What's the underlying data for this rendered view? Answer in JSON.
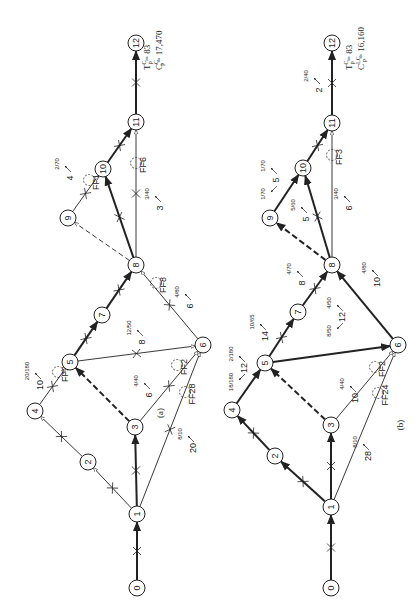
{
  "figure": {
    "rotation_deg": -90
  },
  "diagrams": [
    {
      "id": "a",
      "caption": "(a)",
      "caption_pos": [
        163,
        413
      ],
      "summary": {
        "time_label": "T",
        "time_sup": "C",
        "time_sub": "P",
        "time_value": "= 83",
        "cost_label": "C",
        "cost_sup": "C",
        "cost_sub": "P",
        "cost_value": "= 17,470",
        "pos": [
          150,
          30
        ]
      },
      "nodes": [
        {
          "id": "0",
          "x": 137,
          "y": 588
        },
        {
          "id": "1",
          "x": 137,
          "y": 514
        },
        {
          "id": "2",
          "x": 88,
          "y": 462
        },
        {
          "id": "3",
          "x": 135,
          "y": 427
        },
        {
          "id": "4",
          "x": 35,
          "y": 411
        },
        {
          "id": "5",
          "x": 70,
          "y": 362
        },
        {
          "id": "6",
          "x": 203,
          "y": 345
        },
        {
          "id": "7",
          "x": 102,
          "y": 315
        },
        {
          "id": "8",
          "x": 136,
          "y": 265
        },
        {
          "id": "9",
          "x": 68,
          "y": 218
        },
        {
          "id": "10",
          "x": 103,
          "y": 169
        },
        {
          "id": "11",
          "x": 136,
          "y": 122
        },
        {
          "id": "12",
          "x": 136,
          "y": 43
        }
      ],
      "edges": [
        {
          "from": "0",
          "to": "1",
          "style": "bold",
          "cross": true
        },
        {
          "from": "1",
          "to": "2",
          "style": "thin",
          "cross": true,
          "open_arrow": true
        },
        {
          "from": "1",
          "to": "3",
          "style": "bold",
          "cross": true
        },
        {
          "from": "1",
          "to": "6",
          "style": "thin",
          "cross": true,
          "open_arrow": true
        },
        {
          "from": "2",
          "to": "4",
          "style": "thin",
          "cross": true,
          "open_arrow": true
        },
        {
          "from": "4",
          "to": "5",
          "style": "thin",
          "cross": true,
          "open_arrow": true
        },
        {
          "from": "3",
          "to": "5",
          "style": "bold-dashed",
          "cross": false
        },
        {
          "from": "3",
          "to": "6",
          "style": "thin",
          "cross": true,
          "open_arrow": true
        },
        {
          "from": "5",
          "to": "6",
          "style": "thin",
          "cross": true,
          "open_arrow": true
        },
        {
          "from": "5",
          "to": "7",
          "style": "bold",
          "cross": true
        },
        {
          "from": "7",
          "to": "8",
          "style": "bold",
          "cross": true
        },
        {
          "from": "6",
          "to": "8",
          "style": "thin",
          "cross": true,
          "open_arrow": true
        },
        {
          "from": "8",
          "to": "9",
          "style": "thin-dashed",
          "cross": false,
          "open_arrow": true
        },
        {
          "from": "8",
          "to": "10",
          "style": "bold",
          "cross": true
        },
        {
          "from": "8",
          "to": "11",
          "style": "thin",
          "cross": true,
          "open_arrow": true
        },
        {
          "from": "9",
          "to": "10",
          "style": "thin",
          "cross": true,
          "open_arrow": true
        },
        {
          "from": "10",
          "to": "11",
          "style": "bold",
          "cross": true
        },
        {
          "from": "11",
          "to": "12",
          "style": "bold",
          "cross": true
        }
      ],
      "float_markers": [
        {
          "label": "FF2",
          "x": 58,
          "y": 372
        },
        {
          "label": "FF2",
          "x": 177,
          "y": 365
        },
        {
          "label": "FF28",
          "x": 185,
          "y": 392
        },
        {
          "label": "FF8",
          "x": 156,
          "y": 283
        },
        {
          "label": "FF1",
          "x": 89,
          "y": 180
        },
        {
          "label": "FF6",
          "x": 136,
          "y": 163
        }
      ],
      "annotations": [
        {
          "value": "10",
          "rate": "20/180",
          "x": 43,
          "y": 385
        },
        {
          "value": "6",
          "rate": "4/40",
          "x": 152,
          "y": 395
        },
        {
          "value": "20",
          "rate": "8/10",
          "x": 196,
          "y": 448
        },
        {
          "value": "8",
          "rate": "12/50",
          "x": 145,
          "y": 342
        },
        {
          "value": "6",
          "rate": "4/80",
          "x": 193,
          "y": 306
        },
        {
          "value": "4",
          "rate": "2/70",
          "x": 73,
          "y": 178
        },
        {
          "value": "3",
          "rate": "3/40",
          "x": 163,
          "y": 208
        }
      ]
    },
    {
      "id": "b",
      "caption": "(b)",
      "caption_pos": [
        403,
        425
      ],
      "summary": {
        "time_label": "T",
        "time_sup": "C",
        "time_sub": "P",
        "time_value": "= 83",
        "cost_label": "C",
        "cost_sup": "LC",
        "cost_sub": "P",
        "cost_value": "= 16,160",
        "pos": [
          352,
          30
        ]
      },
      "nodes": [
        {
          "id": "0",
          "x": 331,
          "y": 588
        },
        {
          "id": "1",
          "x": 331,
          "y": 507
        },
        {
          "id": "2",
          "x": 275,
          "y": 456
        },
        {
          "id": "3",
          "x": 331,
          "y": 425
        },
        {
          "id": "4",
          "x": 232,
          "y": 410
        },
        {
          "id": "5",
          "x": 265,
          "y": 363
        },
        {
          "id": "6",
          "x": 398,
          "y": 345
        },
        {
          "id": "7",
          "x": 298,
          "y": 312
        },
        {
          "id": "8",
          "x": 332,
          "y": 265
        },
        {
          "id": "9",
          "x": 270,
          "y": 218
        },
        {
          "id": "10",
          "x": 303,
          "y": 168
        },
        {
          "id": "11",
          "x": 332,
          "y": 123
        },
        {
          "id": "12",
          "x": 332,
          "y": 43
        }
      ],
      "edges": [
        {
          "from": "0",
          "to": "1",
          "style": "bold",
          "cross": true
        },
        {
          "from": "1",
          "to": "2",
          "style": "bold",
          "cross": true
        },
        {
          "from": "1",
          "to": "3",
          "style": "bold",
          "cross": true
        },
        {
          "from": "1",
          "to": "6",
          "style": "thin",
          "cross": false,
          "open_arrow": true
        },
        {
          "from": "2",
          "to": "4",
          "style": "bold",
          "cross": true
        },
        {
          "from": "4",
          "to": "5",
          "style": "bold",
          "cross": false
        },
        {
          "from": "3",
          "to": "5",
          "style": "bold-dashed",
          "cross": false
        },
        {
          "from": "3",
          "to": "6",
          "style": "thin",
          "cross": false,
          "open_arrow": true
        },
        {
          "from": "5",
          "to": "6",
          "style": "bold",
          "cross": false
        },
        {
          "from": "5",
          "to": "7",
          "style": "bold",
          "cross": true
        },
        {
          "from": "7",
          "to": "8",
          "style": "bold",
          "cross": true
        },
        {
          "from": "6",
          "to": "8",
          "style": "bold",
          "cross": false
        },
        {
          "from": "8",
          "to": "9",
          "style": "bold-dashed",
          "cross": false
        },
        {
          "from": "8",
          "to": "10",
          "style": "bold",
          "cross": true
        },
        {
          "from": "8",
          "to": "11",
          "style": "thin",
          "cross": false,
          "open_arrow": true
        },
        {
          "from": "9",
          "to": "10",
          "style": "bold",
          "cross": false
        },
        {
          "from": "10",
          "to": "11",
          "style": "bold",
          "cross": true
        },
        {
          "from": "11",
          "to": "12",
          "style": "bold",
          "cross": true
        }
      ],
      "float_markers": [
        {
          "label": "FF2",
          "x": 375,
          "y": 367
        },
        {
          "label": "FF24",
          "x": 378,
          "y": 393
        },
        {
          "label": "FF3",
          "x": 332,
          "y": 155
        }
      ],
      "annotations": [
        {
          "value": "12",
          "rate": "2/180",
          "rate2": "18/180",
          "x": 247,
          "y": 368
        },
        {
          "value": "14",
          "rate": "10/65",
          "x": 268,
          "y": 336
        },
        {
          "value": "10",
          "rate": "4/40",
          "x": 358,
          "y": 398
        },
        {
          "value": "28",
          "rate": "8/10",
          "x": 371,
          "y": 456
        },
        {
          "value": "12",
          "rate": "4/50",
          "rate2": "8/50",
          "x": 345,
          "y": 317
        },
        {
          "value": "8",
          "rate": "4/70",
          "x": 305,
          "y": 283
        },
        {
          "value": "10",
          "rate": "4/80",
          "x": 380,
          "y": 282
        },
        {
          "value": "5",
          "rate": "1/70",
          "rate2": "1/70",
          "x": 279,
          "y": 180
        },
        {
          "value": "5",
          "rate": "5/60",
          "x": 309,
          "y": 219
        },
        {
          "value": "6",
          "rate": "3/40",
          "x": 352,
          "y": 208
        },
        {
          "value": "2",
          "rate": "2/40",
          "x": 322,
          "y": 90
        }
      ]
    }
  ]
}
